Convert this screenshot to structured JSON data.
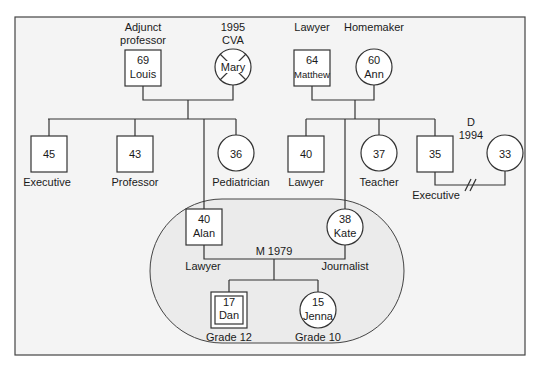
{
  "diagram": {
    "type": "genogram",
    "colors": {
      "frame_bg": "#f4f4f4",
      "ellipse_bg": "#e9e9e9",
      "line": "#333333",
      "node_bg": "#ffffff"
    },
    "generation1": {
      "louis": {
        "label_above": [
          "Adjunct",
          "professor"
        ],
        "age": "69",
        "name": "Louis",
        "sex": "male"
      },
      "mary": {
        "label_above": [
          "1995",
          "CVA"
        ],
        "name": "Mary",
        "sex": "female",
        "deceased": true
      },
      "matthew": {
        "label_above": [
          "Lawyer"
        ],
        "age": "64",
        "name": "Matthew",
        "sex": "male"
      },
      "ann": {
        "label_above": [
          "Homemaker"
        ],
        "age": "60",
        "name": "Ann",
        "sex": "female"
      }
    },
    "generation2": {
      "louis_children": [
        {
          "age": "45",
          "sex": "male",
          "occupation": "Executive"
        },
        {
          "age": "43",
          "sex": "male",
          "occupation": "Professor"
        },
        {
          "age": "36",
          "sex": "female",
          "occupation": "Pediatrician"
        }
      ],
      "matthew_children": [
        {
          "age": "40",
          "sex": "male",
          "occupation": "Lawyer"
        },
        {
          "age": "37",
          "sex": "female",
          "occupation": "Teacher"
        },
        {
          "age": "35",
          "sex": "male",
          "occupation": "Executive"
        }
      ],
      "divorced_partner": {
        "age": "33",
        "sex": "female",
        "divorce_label": [
          "D",
          "1994"
        ]
      }
    },
    "household": {
      "alan": {
        "age": "40",
        "name": "Alan",
        "sex": "male",
        "occupation": "Lawyer"
      },
      "kate": {
        "age": "38",
        "name": "Kate",
        "sex": "female",
        "occupation": "Journalist"
      },
      "marriage": "M 1979",
      "dan": {
        "age": "17",
        "name": "Dan",
        "sex": "male",
        "identified_patient": true,
        "grade": "Grade 12"
      },
      "jenna": {
        "age": "15",
        "name": "Jenna",
        "sex": "female",
        "grade": "Grade 10"
      }
    }
  }
}
